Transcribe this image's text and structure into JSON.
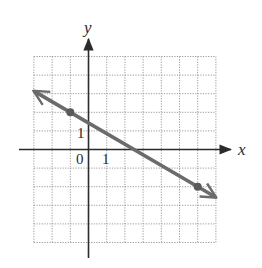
{
  "chart_data": {
    "type": "line",
    "title": "",
    "xlabel": "x",
    "ylabel": "y",
    "xlim": [
      -3,
      7
    ],
    "ylim": [
      -5,
      5
    ],
    "grid": true,
    "grid_style": "dotted",
    "tick_labels": {
      "origin": "0",
      "x": [
        {
          "value": 1,
          "label": "1"
        }
      ],
      "y": [
        {
          "value": 1,
          "label": "1"
        }
      ]
    },
    "series": [
      {
        "name": "line",
        "slope": -0.5714,
        "intercept": 1.4286,
        "equation": "4x + 7y = 10",
        "marked_points": [
          {
            "x": -1,
            "y": 2
          },
          {
            "x": 6,
            "y": -2
          }
        ],
        "arrows_both_ends": true
      }
    ],
    "legend": null
  },
  "colors": {
    "axis": "#2b2b2b",
    "grid": "#9a9a9a",
    "line": "#6b6b6b",
    "point": "#5a5a5a",
    "background": "#ffffff"
  },
  "labels": {
    "x_axis": "x",
    "y_axis": "y",
    "origin": "0",
    "x_tick_1": "1",
    "y_tick_1": "1"
  }
}
